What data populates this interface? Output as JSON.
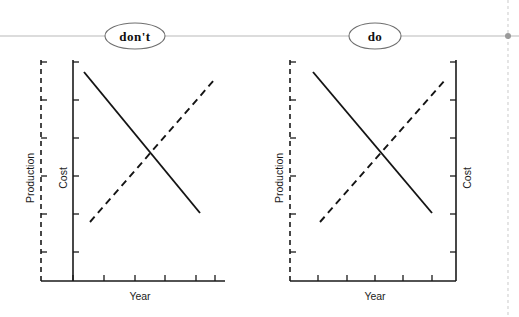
{
  "figure": {
    "width": 519,
    "height": 317,
    "background": "#ffffff",
    "ink_color": "#141414",
    "connector_color": "#b9b9b9",
    "guide_color": "#cfcfcf"
  },
  "header": {
    "connector_line_y": 36,
    "nodes": [
      {
        "id": "dont",
        "label": "don't",
        "cx": 135,
        "cy": 36,
        "rx": 30,
        "ry": 13
      },
      {
        "id": "do",
        "label": "do",
        "cx": 375,
        "cy": 36,
        "rx": 26,
        "ry": 13
      }
    ],
    "guide": {
      "x": 508,
      "dot_y": 36
    }
  },
  "panels": [
    {
      "id": "dont-panel",
      "variant": "dont",
      "plot": {
        "left": 41,
        "right": 225,
        "top": 60,
        "bottom": 281
      },
      "xaxis": {
        "label": "Year",
        "label_x": 140,
        "label_y": 296,
        "line": {
          "x1": 41,
          "x2": 225,
          "y": 281
        },
        "ticks": [
          73,
          104,
          135,
          165,
          196,
          215
        ]
      },
      "yaxes": [
        {
          "id": "production",
          "label": "Production",
          "style": "dashed",
          "side": "left",
          "x": 41,
          "label_x": 30,
          "label_y": 178,
          "tick_dir": "right",
          "ticks": [
            62,
            100,
            138,
            176,
            214,
            252
          ]
        },
        {
          "id": "cost",
          "label": "Cost",
          "style": "solid",
          "side": "left",
          "x": 73,
          "label_x": 63,
          "label_y": 178,
          "tick_dir": "right",
          "ticks": [
            62,
            100,
            138,
            176,
            214,
            252
          ]
        }
      ],
      "series": [
        {
          "id": "cost-series",
          "style": "solid",
          "x1": 84,
          "y1": 72,
          "x2": 200,
          "y2": 213
        },
        {
          "id": "production-series",
          "style": "dashed",
          "x1": 90,
          "y1": 222,
          "x2": 215,
          "y2": 79
        }
      ]
    },
    {
      "id": "do-panel",
      "variant": "do",
      "plot": {
        "left": 290,
        "right": 456,
        "top": 60,
        "bottom": 281
      },
      "xaxis": {
        "label": "Year",
        "label_x": 375,
        "label_y": 296,
        "line": {
          "x1": 290,
          "x2": 456,
          "y": 281
        },
        "ticks": [
          318,
          347,
          375,
          403,
          432
        ]
      },
      "yaxes": [
        {
          "id": "production",
          "label": "Production",
          "style": "dashed",
          "side": "left",
          "x": 290,
          "label_x": 279,
          "label_y": 178,
          "tick_dir": "right",
          "ticks": [
            62,
            100,
            138,
            176,
            214,
            252
          ]
        },
        {
          "id": "cost",
          "label": "Cost",
          "style": "solid",
          "side": "right",
          "x": 456,
          "label_x": 467,
          "label_y": 178,
          "tick_dir": "left",
          "ticks": [
            62,
            100,
            138,
            176,
            214,
            252
          ]
        }
      ],
      "series": [
        {
          "id": "cost-series",
          "style": "solid",
          "x1": 313,
          "y1": 72,
          "x2": 432,
          "y2": 213
        },
        {
          "id": "production-series",
          "style": "dashed",
          "x1": 320,
          "y1": 222,
          "x2": 446,
          "y2": 79
        }
      ]
    }
  ],
  "chart_data": {
    "type": "line",
    "title": "",
    "subtitle": "",
    "panel_count": 2,
    "panels": [
      {
        "name": "don't",
        "caption": "don't",
        "xlabel": "Year",
        "grid": false,
        "legend": "none",
        "note": "Both y-axes stacked on the left side; Production (dashed) outermost, Cost (solid) inner.",
        "axes": [
          {
            "name": "Production",
            "side": "left",
            "linestyle": "dashed",
            "ticks": 6,
            "ticklabels": []
          },
          {
            "name": "Cost",
            "side": "left",
            "linestyle": "solid",
            "ticks": 6,
            "ticklabels": []
          }
        ],
        "series": [
          {
            "name": "Cost",
            "linestyle": "solid",
            "axis": "Cost",
            "trend": "decreasing",
            "x": [
              0.23,
              0.86
            ],
            "y": [
              0.95,
              0.31
            ]
          },
          {
            "name": "Production",
            "linestyle": "dashed",
            "axis": "Production",
            "trend": "increasing",
            "x": [
              0.27,
              0.95
            ],
            "y": [
              0.27,
              0.91
            ]
          }
        ]
      },
      {
        "name": "do",
        "caption": "do",
        "xlabel": "Year",
        "grid": false,
        "legend": "none",
        "note": "Production (dashed) on the left axis; Cost (solid) on the right axis.",
        "axes": [
          {
            "name": "Production",
            "side": "left",
            "linestyle": "dashed",
            "ticks": 6,
            "ticklabels": []
          },
          {
            "name": "Cost",
            "side": "right",
            "linestyle": "solid",
            "ticks": 6,
            "ticklabels": []
          }
        ],
        "series": [
          {
            "name": "Cost",
            "linestyle": "solid",
            "axis": "Cost",
            "trend": "decreasing",
            "x": [
              0.14,
              0.86
            ],
            "y": [
              0.95,
              0.31
            ]
          },
          {
            "name": "Production",
            "linestyle": "dashed",
            "axis": "Production",
            "trend": "increasing",
            "x": [
              0.18,
              0.94
            ],
            "y": [
              0.27,
              0.91
            ]
          }
        ]
      }
    ]
  }
}
